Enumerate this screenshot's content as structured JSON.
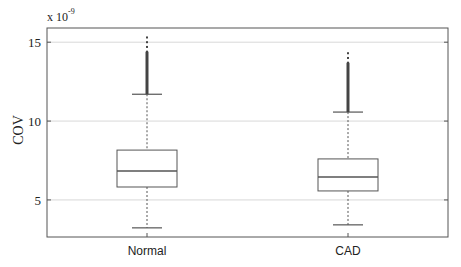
{
  "chart_data": {
    "type": "box",
    "title": "",
    "xlabel": "",
    "ylabel": "COV",
    "y_scale_multiplier": "x 10^-9",
    "y_scale_base": "x 10",
    "y_scale_exponent": "-9",
    "ylim": [
      2.65,
      15.9
    ],
    "yticks": [
      5,
      10,
      15
    ],
    "ytick_labels": [
      "5",
      "10",
      "15"
    ],
    "grid": {
      "horizontal": true,
      "vertical": false
    },
    "legend": null,
    "categories": [
      "Normal",
      "CAD"
    ],
    "series": [
      {
        "name": "Normal",
        "whisker_low": 3.23,
        "q1": 5.82,
        "median": 6.84,
        "q3": 8.16,
        "whisker_high": 11.7,
        "outliers_range": [
          11.7,
          15.4
        ],
        "outliers_dense_range": [
          11.7,
          14.4
        ]
      },
      {
        "name": "CAD",
        "whisker_low": 3.42,
        "q1": 5.57,
        "median": 6.46,
        "q3": 7.6,
        "whisker_high": 10.57,
        "outliers_range": [
          10.57,
          14.5
        ],
        "outliers_dense_range": [
          10.57,
          13.7
        ]
      }
    ]
  },
  "colors": {
    "axis": "#555555",
    "grid": "#d8d8d8",
    "box": "#555555",
    "outlier": "#444444",
    "text": "#222222"
  }
}
